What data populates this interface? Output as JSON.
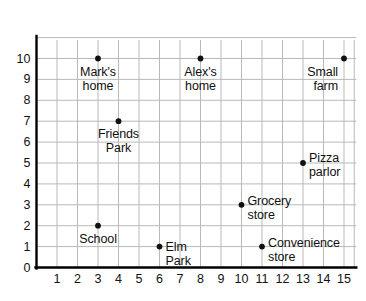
{
  "chart_data": {
    "type": "scatter",
    "title": "",
    "xlabel": "",
    "ylabel": "",
    "xlim": [
      0,
      15.6
    ],
    "ylim": [
      0,
      11.2
    ],
    "grid": true,
    "legend": "none",
    "x_ticks": [
      "1",
      "2",
      "3",
      "4",
      "5",
      "6",
      "7",
      "8",
      "9",
      "10",
      "11",
      "12",
      "13",
      "14",
      "15"
    ],
    "y_ticks": [
      "0",
      "1",
      "2",
      "3",
      "4",
      "5",
      "6",
      "7",
      "8",
      "9",
      "10"
    ],
    "points": [
      {
        "label": "Mark's\nhome",
        "x": 3,
        "y": 10,
        "align": "center",
        "label_dx": 0,
        "label_dy": 6
      },
      {
        "label": "Alex's\nhome",
        "x": 8,
        "y": 10,
        "align": "center",
        "label_dx": 0,
        "label_dy": 6
      },
      {
        "label": "Small\nfarm",
        "x": 15,
        "y": 10,
        "align": "right",
        "label_dx": -6,
        "label_dy": 6
      },
      {
        "label": "Friends\nPark",
        "x": 4,
        "y": 7,
        "align": "center",
        "label_dx": 0,
        "label_dy": 6
      },
      {
        "label": "Pizza\nparlor",
        "x": 13,
        "y": 5,
        "align": "left",
        "label_dx": 6,
        "label_dy": -12
      },
      {
        "label": "Grocery\nstore",
        "x": 10,
        "y": 3,
        "align": "left",
        "label_dx": 6,
        "label_dy": -11
      },
      {
        "label": "School",
        "x": 3,
        "y": 2,
        "align": "center",
        "label_dx": 0,
        "label_dy": 6
      },
      {
        "label": "Elm\nPark",
        "x": 6,
        "y": 1,
        "align": "left",
        "label_dx": 6,
        "label_dy": -7
      },
      {
        "label": "Convenience\nstore",
        "x": 11,
        "y": 1,
        "align": "left",
        "label_dx": 6,
        "label_dy": -11
      }
    ],
    "colors": {
      "point": "#111111",
      "grid": "#b9b9b9",
      "axis": "#000000",
      "text": "#101010",
      "background": "#ffffff"
    }
  }
}
